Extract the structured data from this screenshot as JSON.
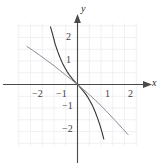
{
  "figure": {
    "name": "coordinate-plane-graph",
    "background_color": "#ffffff",
    "grid_color": "#ececf2",
    "axis_color": "#4a4a4a",
    "curve_dark_color": "#333333",
    "curve_light_color": "#8c8c94"
  },
  "axes": {
    "x_name": "x",
    "y_name": "y",
    "x_ticks": [
      {
        "label": "−2",
        "value": -2
      },
      {
        "label": "−1",
        "value": -1
      },
      {
        "label": "1",
        "value": 1
      },
      {
        "label": "2",
        "value": 2
      }
    ],
    "y_ticks": [
      {
        "label": "2",
        "value": 2
      },
      {
        "label": "1",
        "value": 1
      },
      {
        "label": "−1",
        "value": -1
      },
      {
        "label": "−2",
        "value": -2
      }
    ]
  },
  "chart_data": {
    "type": "line",
    "title": "",
    "subtitle": "",
    "xlabel": "x",
    "ylabel": "y",
    "xlim": [
      -2.9,
      2.9
    ],
    "ylim": [
      -2.9,
      2.9
    ],
    "grid": true,
    "grid_spacing": 0.5,
    "legend": "none",
    "annotations": [],
    "series": [
      {
        "name": "steep-decreasing-curve",
        "color": "#333333",
        "width": 1.1,
        "points": [
          [
            -1.15,
            2.45
          ],
          [
            -1.05,
            2.1
          ],
          [
            -0.95,
            1.72
          ],
          [
            -0.85,
            1.42
          ],
          [
            -0.75,
            1.16
          ],
          [
            -0.65,
            0.93
          ],
          [
            -0.55,
            0.73
          ],
          [
            -0.45,
            0.56
          ],
          [
            -0.35,
            0.41
          ],
          [
            -0.25,
            0.28
          ],
          [
            -0.15,
            0.16
          ],
          [
            -0.05,
            0.05
          ],
          [
            0.0,
            0.0
          ],
          [
            0.05,
            -0.05
          ],
          [
            0.15,
            -0.16
          ],
          [
            0.25,
            -0.28
          ],
          [
            0.35,
            -0.41
          ],
          [
            0.45,
            -0.56
          ],
          [
            0.55,
            -0.73
          ],
          [
            0.65,
            -0.93
          ],
          [
            0.75,
            -1.16
          ],
          [
            0.85,
            -1.42
          ],
          [
            0.95,
            -1.72
          ],
          [
            1.05,
            -2.05
          ],
          [
            1.12,
            -2.32
          ]
        ]
      },
      {
        "name": "shallow-decreasing-curve",
        "color": "#8c8c94",
        "width": 1.0,
        "points": [
          [
            -2.15,
            1.62
          ],
          [
            -1.9,
            1.45
          ],
          [
            -1.6,
            1.24
          ],
          [
            -1.3,
            1.02
          ],
          [
            -1.0,
            0.8
          ],
          [
            -0.75,
            0.6
          ],
          [
            -0.5,
            0.4
          ],
          [
            -0.25,
            0.2
          ],
          [
            0.0,
            0.0
          ],
          [
            0.25,
            -0.21
          ],
          [
            0.5,
            -0.43
          ],
          [
            0.75,
            -0.66
          ],
          [
            1.0,
            -0.9
          ],
          [
            1.3,
            -1.21
          ],
          [
            1.6,
            -1.53
          ],
          [
            1.9,
            -1.86
          ],
          [
            2.15,
            -2.13
          ]
        ]
      }
    ]
  }
}
